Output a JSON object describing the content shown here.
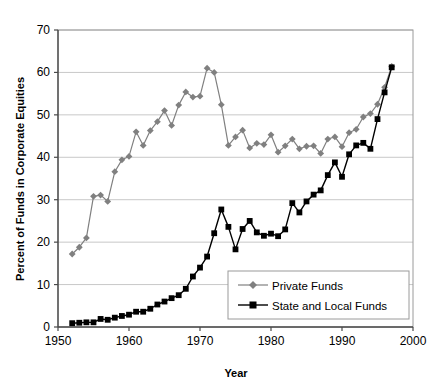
{
  "chart_data": {
    "type": "line",
    "title": "",
    "xlabel": "Year",
    "ylabel": "Percent of Funds in Corporate Equities",
    "xlim": [
      1950,
      2000
    ],
    "ylim": [
      0,
      70
    ],
    "xticks": [
      1950,
      1960,
      1970,
      1980,
      1990,
      2000
    ],
    "yticks": [
      0,
      10,
      20,
      30,
      40,
      50,
      60,
      70
    ],
    "grid": "horizontal",
    "legend_position": "lower-right-inside",
    "x": [
      1952,
      1953,
      1954,
      1955,
      1956,
      1957,
      1958,
      1959,
      1960,
      1961,
      1962,
      1963,
      1964,
      1965,
      1966,
      1967,
      1968,
      1969,
      1970,
      1971,
      1972,
      1973,
      1974,
      1975,
      1976,
      1977,
      1978,
      1979,
      1980,
      1981,
      1982,
      1983,
      1984,
      1985,
      1986,
      1987,
      1988,
      1989,
      1990,
      1991,
      1992,
      1993,
      1994,
      1995,
      1996,
      1997
    ],
    "series": [
      {
        "name": "Private Funds",
        "color": "#808080",
        "marker": "diamond",
        "values": [
          17.2,
          18.8,
          21.0,
          30.8,
          31.1,
          29.6,
          36.6,
          39.4,
          40.2,
          46.0,
          42.8,
          46.3,
          48.4,
          51.0,
          47.5,
          52.3,
          55.4,
          54.2,
          54.4,
          61.0,
          60.0,
          52.4,
          42.8,
          44.8,
          46.4,
          42.2,
          43.3,
          43.0,
          45.3,
          41.2,
          42.7,
          44.3,
          42.0,
          42.6,
          42.7,
          40.9,
          44.3,
          44.8,
          42.5,
          45.8,
          46.6,
          49.5,
          50.3,
          52.5,
          56.5,
          61.4
        ]
      },
      {
        "name": "State and Local Funds",
        "color": "#000000",
        "marker": "square",
        "values": [
          0.9,
          1.0,
          1.1,
          1.1,
          1.9,
          1.7,
          2.2,
          2.6,
          2.9,
          3.6,
          3.6,
          4.3,
          5.3,
          6.0,
          6.8,
          7.5,
          9.0,
          11.9,
          14.0,
          16.6,
          22.1,
          27.7,
          23.6,
          18.3,
          23.1,
          25.0,
          22.3,
          21.5,
          22.0,
          21.4,
          23.0,
          29.2,
          27.0,
          29.6,
          31.2,
          32.2,
          35.8,
          38.8,
          35.4,
          40.7,
          42.8,
          43.4,
          42.0,
          49.0,
          55.3,
          61.2
        ]
      }
    ]
  },
  "legend": {
    "entries": [
      {
        "label": "Private Funds"
      },
      {
        "label": "State and Local Funds"
      }
    ]
  },
  "axes": {
    "x_title": "Year",
    "y_title": "Percent of Funds in Corporate Equities",
    "x_tick_labels": [
      "1950",
      "1960",
      "1970",
      "1980",
      "1990",
      "2000"
    ],
    "y_tick_labels": [
      "0",
      "10",
      "20",
      "30",
      "40",
      "50",
      "60",
      "70"
    ]
  }
}
